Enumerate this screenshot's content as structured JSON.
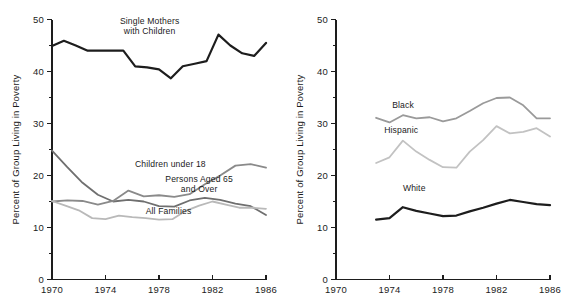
{
  "figure": {
    "background_color": "#ffffff",
    "panel_count": 2
  },
  "chart_data": [
    {
      "type": "line",
      "panel": "left",
      "title": "",
      "xlabel": "",
      "ylabel": "Percent of Group Living in Poverty",
      "xlim": [
        1970,
        1986
      ],
      "ylim": [
        0,
        50
      ],
      "grid": false,
      "legend_position": "inline-annotations",
      "xticks": [
        1970,
        1974,
        1978,
        1982,
        1986
      ],
      "xtick_labels": [
        "1970",
        "1974",
        "1978",
        "1982",
        "1986"
      ],
      "yticks": [
        0,
        10,
        20,
        30,
        40,
        50
      ],
      "ytick_labels": [
        "0",
        "10",
        "20",
        "30",
        "40",
        "50"
      ],
      "yminor_ticks": [
        5,
        15,
        25,
        35,
        45
      ],
      "x": [
        1970,
        1971,
        1972,
        1973,
        1974,
        1975,
        1976,
        1977,
        1978,
        1979,
        1980,
        1981,
        1982,
        1983,
        1984,
        1985,
        1986
      ],
      "series": [
        {
          "name": "Single Mothers with Children",
          "color": "#1d1d1d",
          "width": 2.2,
          "label_x": 1977.3,
          "label_y": 49.2,
          "values": [
            44.9,
            45.9,
            45.0,
            44.0,
            44.0,
            44.0,
            44.0,
            41.0,
            40.8,
            40.4,
            38.7,
            41.0,
            41.5,
            42.0,
            47.1,
            45.0,
            43.5,
            43.0,
            45.5
          ]
        },
        {
          "name": "Persons Aged 65 and Over",
          "color": "#6f6f6f",
          "width": 1.8,
          "label_x": 1981.0,
          "label_y": 18.8,
          "values": [
            24.8,
            21.6,
            18.6,
            16.3,
            15.0,
            15.3,
            15.0,
            14.1,
            14.0,
            15.2,
            15.7,
            15.3,
            14.6,
            14.1,
            12.4
          ]
        },
        {
          "name": "Children under 18",
          "color": "#8a8a8a",
          "width": 1.8,
          "label_x": 1976.2,
          "label_y": 21.6,
          "values": [
            15.0,
            15.2,
            15.1,
            14.4,
            15.1,
            17.1,
            16.0,
            16.2,
            15.9,
            16.4,
            18.3,
            20.0,
            21.9,
            22.2,
            21.5
          ]
        },
        {
          "name": "All Families",
          "color": "#b9b9b9",
          "width": 1.8,
          "label_x": 1977.0,
          "label_y": 12.6,
          "values": [
            15.1,
            14.2,
            13.3,
            11.8,
            11.6,
            12.3,
            12.0,
            11.8,
            11.5,
            11.6,
            13.2,
            14.2,
            15.0,
            14.4,
            13.8,
            13.8,
            13.6
          ]
        }
      ]
    },
    {
      "type": "line",
      "panel": "right",
      "title": "",
      "xlabel": "",
      "ylabel": "Percent of Group Living in Poverty",
      "xlim": [
        1970,
        1986
      ],
      "ylim": [
        0,
        50
      ],
      "grid": false,
      "legend_position": "inline-annotations",
      "xticks": [
        1970,
        1974,
        1978,
        1982,
        1986
      ],
      "xtick_labels": [
        "1970",
        "1974",
        "1978",
        "1982",
        "1986"
      ],
      "yticks": [
        0,
        10,
        20,
        30,
        40,
        50
      ],
      "ytick_labels": [
        "0",
        "10",
        "20",
        "30",
        "40",
        "50"
      ],
      "yminor_ticks": [
        5,
        15,
        25,
        35,
        45
      ],
      "x": [
        1973,
        1974,
        1975,
        1976,
        1977,
        1978,
        1979,
        1980,
        1981,
        1982,
        1983,
        1984,
        1985,
        1986
      ],
      "series": [
        {
          "name": "Black",
          "color": "#9a9a9a",
          "width": 1.8,
          "label_x": 1974.2,
          "label_y": 32.9,
          "values": [
            31.1,
            30.2,
            31.6,
            31.0,
            31.2,
            30.4,
            31.0,
            32.4,
            33.9,
            34.9,
            35.0,
            33.5,
            31.0,
            31.0
          ]
        },
        {
          "name": "Hispanic",
          "color": "#c2c2c2",
          "width": 1.8,
          "label_x": 1973.6,
          "label_y": 28.2,
          "values": [
            22.4,
            23.5,
            26.7,
            24.6,
            23.0,
            21.6,
            21.5,
            24.6,
            26.8,
            29.5,
            28.1,
            28.4,
            29.1,
            27.5
          ]
        },
        {
          "name": "White",
          "color": "#1d1d1d",
          "width": 2.2,
          "label_x": 1975.0,
          "label_y": 17.0,
          "values": [
            11.5,
            11.8,
            13.9,
            13.2,
            12.7,
            12.2,
            12.3,
            13.1,
            13.8,
            14.6,
            15.3,
            14.9,
            14.5,
            14.3
          ]
        }
      ]
    }
  ]
}
